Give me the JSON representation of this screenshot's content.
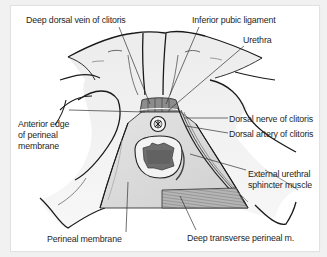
{
  "figure": {
    "type": "anatomical-diagram",
    "colors": {
      "background": "#f1f1f1",
      "card": "#ffffff",
      "bone_fill": "#e9e9e9",
      "bone_outline": "#1a1a1a",
      "membrane_fill": "#dcdcdc",
      "muscle_fill": "#a9a9a9",
      "label_text": "#1f1f1f",
      "leader_line": "#333333"
    }
  },
  "labels": {
    "deep_dorsal_vein": "Deep dorsal vein of clitoris",
    "inferior_pubic_ligament": "Inferior pubic ligament",
    "urethra": "Urethra",
    "anterior_edge_line1": "Anterior edge",
    "anterior_edge_line2": "of perineal",
    "anterior_edge_line3": "membrane",
    "dorsal_nerve": "Dorsal nerve of clitoris",
    "dorsal_artery": "Dorsal artery of clitoris",
    "external_urethral_line1": "External urethral",
    "external_urethral_line2": "sphincter muscle",
    "perineal_membrane": "Perineal membrane",
    "deep_transverse": "Deep transverse perineal m."
  }
}
